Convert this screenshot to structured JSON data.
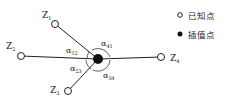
{
  "diagram": {
    "known_points": [
      {
        "id": "Z1",
        "label": "Z",
        "sub": "1",
        "x": 55,
        "y": 24,
        "lx": 42,
        "ly": 18
      },
      {
        "id": "Z2",
        "label": "Z",
        "sub": "2",
        "x": 21,
        "y": 56,
        "lx": 6,
        "ly": 49
      },
      {
        "id": "Z3",
        "label": "Z",
        "sub": "3",
        "x": 68,
        "y": 91,
        "lx": 50,
        "ly": 93
      },
      {
        "id": "Z4",
        "label": "Z",
        "sub": "4",
        "x": 161,
        "y": 57,
        "lx": 170,
        "ly": 61
      }
    ],
    "interpolation_point": {
      "x": 98,
      "y": 59
    },
    "angles": [
      {
        "label": "α",
        "sub": "12",
        "x": 66,
        "y": 53
      },
      {
        "label": "α",
        "sub": "41",
        "x": 101,
        "y": 46
      },
      {
        "label": "α",
        "sub": "23",
        "x": 70,
        "y": 71
      },
      {
        "label": "α",
        "sub": "34",
        "x": 103,
        "y": 78
      }
    ]
  },
  "legend": {
    "known_label": "已知点",
    "interp_label": "插值点"
  },
  "colors": {
    "stroke": "#222222",
    "fill": "#111111"
  }
}
